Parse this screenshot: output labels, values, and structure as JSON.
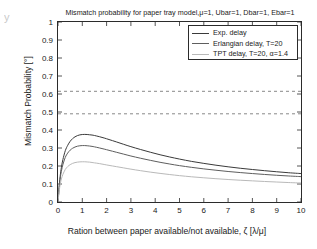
{
  "figure": {
    "corner_artifact": "y",
    "background": "#ffffff"
  },
  "chart_data": {
    "type": "line",
    "title": "Mismatch probability for paper tray model,μ=1, Ubar=1, Dbar=1, Ebar=1",
    "xlabel": "Ration between paper available/not available, ζ [λ/μ]",
    "ylabel": "Mismatch Probability [°]",
    "xlim": [
      0,
      10
    ],
    "ylim": [
      0,
      1
    ],
    "xticks": [
      0,
      1,
      2,
      3,
      4,
      5,
      6,
      7,
      8,
      9,
      10
    ],
    "xtick_labels": [
      "0",
      "1",
      "2",
      "3",
      "4",
      "5",
      "6",
      "7",
      "8",
      "9",
      "10"
    ],
    "yticks": [
      0,
      0.1,
      0.2,
      0.3,
      0.4,
      0.5,
      0.6,
      0.7,
      0.8,
      0.9,
      1
    ],
    "ytick_labels": [
      "0",
      "0.1",
      "0.2",
      "0.3",
      "0.4",
      "0.5",
      "0.6",
      "0.7",
      "0.8",
      "0.9",
      "1"
    ],
    "grid": false,
    "legend_position": "upper right",
    "colors": {
      "exp": "#3a3a3a",
      "erlangian": "#5e5e5e",
      "tpt": "#b9b9b9",
      "asymptote": "#7a7a7a",
      "axis": "#2b2b2b"
    },
    "series": [
      {
        "name": "Exp. delay",
        "color": "#3a3a3a",
        "x": [
          0,
          0.05,
          0.1,
          0.15,
          0.2,
          0.3,
          0.4,
          0.5,
          0.6,
          0.7,
          0.8,
          0.9,
          1.0,
          1.1,
          1.2,
          1.3,
          1.4,
          1.5,
          1.7,
          1.9,
          2.1,
          2.4,
          2.7,
          3.0,
          3.4,
          3.8,
          4.2,
          4.6,
          5.0,
          5.5,
          6.0,
          6.5,
          7.0,
          7.5,
          8.0,
          8.5,
          9.0,
          9.5,
          10.0
        ],
        "y": [
          0.0,
          0.09,
          0.155,
          0.2,
          0.235,
          0.285,
          0.315,
          0.337,
          0.352,
          0.362,
          0.369,
          0.373,
          0.375,
          0.3755,
          0.375,
          0.3735,
          0.372,
          0.3695,
          0.363,
          0.3555,
          0.347,
          0.334,
          0.3205,
          0.3075,
          0.2915,
          0.2765,
          0.2625,
          0.25,
          0.2385,
          0.2255,
          0.2145,
          0.2045,
          0.1955,
          0.1875,
          0.1805,
          0.174,
          0.168,
          0.1625,
          0.158
        ]
      },
      {
        "name": "Erlangian delay, T=20",
        "color": "#5e5e5e",
        "x": [
          0,
          0.05,
          0.1,
          0.15,
          0.2,
          0.3,
          0.4,
          0.5,
          0.6,
          0.7,
          0.8,
          0.9,
          1.0,
          1.1,
          1.2,
          1.3,
          1.4,
          1.5,
          1.7,
          1.9,
          2.1,
          2.4,
          2.7,
          3.0,
          3.4,
          3.8,
          4.2,
          4.6,
          5.0,
          5.5,
          6.0,
          6.5,
          7.0,
          7.5,
          8.0,
          8.5,
          9.0,
          9.5,
          10.0
        ],
        "y": [
          0.0,
          0.082,
          0.14,
          0.178,
          0.207,
          0.248,
          0.272,
          0.288,
          0.2985,
          0.3055,
          0.31,
          0.3125,
          0.3135,
          0.3135,
          0.3125,
          0.311,
          0.309,
          0.3065,
          0.3005,
          0.294,
          0.287,
          0.2765,
          0.266,
          0.2555,
          0.243,
          0.2315,
          0.2205,
          0.211,
          0.202,
          0.1925,
          0.184,
          0.1765,
          0.1695,
          0.1635,
          0.158,
          0.153,
          0.1485,
          0.1445,
          0.141
        ]
      },
      {
        "name": "TPT delay, T=20, α=1.4",
        "color": "#b9b9b9",
        "x": [
          0,
          0.05,
          0.1,
          0.15,
          0.2,
          0.3,
          0.4,
          0.5,
          0.6,
          0.7,
          0.8,
          0.9,
          1.0,
          1.1,
          1.2,
          1.3,
          1.4,
          1.5,
          1.7,
          1.9,
          2.1,
          2.4,
          2.7,
          3.0,
          3.4,
          3.8,
          4.2,
          4.6,
          5.0,
          5.5,
          6.0,
          6.5,
          7.0,
          7.5,
          8.0,
          8.5,
          9.0,
          9.5,
          10.0
        ],
        "y": [
          0.0,
          0.062,
          0.105,
          0.133,
          0.153,
          0.181,
          0.197,
          0.2075,
          0.2145,
          0.219,
          0.2215,
          0.223,
          0.2235,
          0.2235,
          0.2225,
          0.2215,
          0.2195,
          0.2175,
          0.2135,
          0.2085,
          0.2035,
          0.1965,
          0.1895,
          0.1825,
          0.174,
          0.166,
          0.159,
          0.1525,
          0.1465,
          0.14,
          0.1345,
          0.1295,
          0.125,
          0.121,
          0.1175,
          0.114,
          0.111,
          0.108,
          0.1055
        ]
      }
    ],
    "asymptotes": [
      {
        "name": "upper-asymptote",
        "y": 0.615,
        "style": "dashed",
        "color": "#7a7a7a"
      },
      {
        "name": "lower-asymptote",
        "y": 0.49,
        "style": "dashed",
        "color": "#7a7a7a"
      }
    ]
  },
  "legend": {
    "entries": [
      {
        "label": "Exp. delay",
        "color": "#3a3a3a"
      },
      {
        "label": "Erlangian delay, T=20",
        "color": "#5e5e5e"
      },
      {
        "label": "TPT delay, T=20, α=1.4",
        "color": "#b9b9b9"
      }
    ]
  }
}
